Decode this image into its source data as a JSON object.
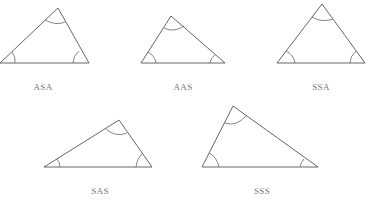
{
  "diagram": {
    "triangles": [
      {
        "id": "asa",
        "label": "ASA",
        "points": [
          [
            58,
            8
          ],
          [
            0,
            63
          ],
          [
            89,
            63
          ]
        ],
        "label_pos": [
          43,
          82
        ]
      },
      {
        "id": "aas",
        "label": "AAS",
        "points": [
          [
            171,
            16
          ],
          [
            141,
            63
          ],
          [
            225,
            63
          ]
        ],
        "label_pos": [
          183,
          82
        ]
      },
      {
        "id": "ssa",
        "label": "SSA",
        "points": [
          [
            322,
            4
          ],
          [
            277,
            63
          ],
          [
            365,
            63
          ]
        ],
        "label_pos": [
          321,
          82
        ]
      },
      {
        "id": "sas",
        "label": "SAS",
        "points": [
          [
            119,
            120
          ],
          [
            44,
            167
          ],
          [
            152,
            167
          ]
        ],
        "label_pos": [
          100,
          186
        ]
      },
      {
        "id": "sss",
        "label": "SSS",
        "points": [
          [
            233,
            106
          ],
          [
            202,
            167
          ],
          [
            318,
            167
          ]
        ],
        "label_pos": [
          262,
          186
        ]
      }
    ],
    "stroke_color": "#555555",
    "label_color": "#777777"
  }
}
